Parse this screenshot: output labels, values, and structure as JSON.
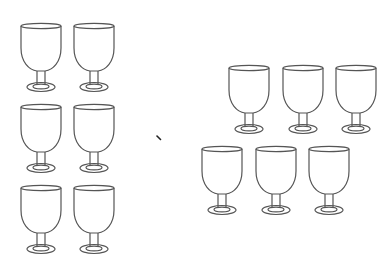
{
  "scene": {
    "description": "Counting illustration: two groups of goblet outlines separated by a small mark",
    "stroke_color": "#555555",
    "background": "#ffffff"
  },
  "groups": [
    {
      "name": "left-group",
      "count": 6,
      "glasses": [
        {
          "x": 19,
          "y": 22
        },
        {
          "x": 72,
          "y": 22
        },
        {
          "x": 19,
          "y": 103
        },
        {
          "x": 72,
          "y": 103
        },
        {
          "x": 19,
          "y": 184
        },
        {
          "x": 72,
          "y": 184
        }
      ]
    },
    {
      "name": "right-group",
      "count": 6,
      "glasses": [
        {
          "x": 227,
          "y": 64
        },
        {
          "x": 281,
          "y": 64
        },
        {
          "x": 334,
          "y": 64
        },
        {
          "x": 200,
          "y": 145
        },
        {
          "x": 254,
          "y": 145
        },
        {
          "x": 307,
          "y": 145
        }
      ]
    }
  ],
  "separator_mark": {
    "x": 156,
    "y": 135
  }
}
